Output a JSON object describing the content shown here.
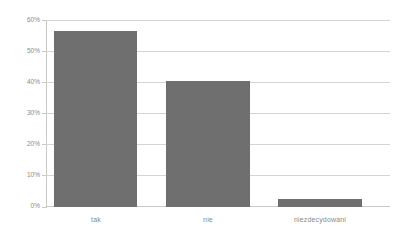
{
  "chart_data": {
    "type": "bar",
    "title": "",
    "subtitle": "",
    "xlabel": "",
    "ylabel": "",
    "categories": [
      "tak",
      "nie",
      "niezdecydowani"
    ],
    "values": [
      56.9,
      40.5,
      2.6
    ],
    "ylim": [
      0,
      60
    ],
    "ytick_values": [
      0,
      10,
      20,
      30,
      40,
      50,
      60
    ],
    "ytick_labels": [
      "0%",
      "10%",
      "20%",
      "30%",
      "40%",
      "50%",
      "60%"
    ],
    "grid": true,
    "legend": false,
    "legend_position": "none",
    "series": [
      {
        "name": "",
        "values": [
          56.9,
          40.5,
          2.6
        ]
      }
    ],
    "colors": {
      "bar": "#6f6f6f",
      "gridline": "#d4d4d4",
      "axis": "#c9c9c9",
      "tick_text": "#8a8a8a",
      "background": "#ffffff"
    }
  }
}
